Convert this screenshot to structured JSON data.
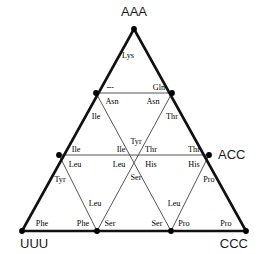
{
  "figure": {
    "colors": {
      "outer_edge": "#111111",
      "inner_line": "#555555",
      "node": "#000000",
      "text": "#000000",
      "corner_text": "#1a1a1a",
      "background": "#ffffff"
    },
    "corners": [
      {
        "id": "aaa",
        "label": "AAA",
        "x": 134,
        "y": 29,
        "text_x": 134,
        "text_y": 16,
        "anchor": "middle"
      },
      {
        "id": "uuu",
        "label": "UUU",
        "x": 22,
        "y": 231,
        "text_x": 20,
        "text_y": 248,
        "anchor": "start"
      },
      {
        "id": "ccc",
        "label": "CCC",
        "x": 246,
        "y": 231,
        "text_x": 248,
        "text_y": 248,
        "anchor": "end"
      },
      {
        "id": "acc",
        "label": "ACC",
        "x": 209,
        "y": 155,
        "text_x": 218,
        "text_y": 159,
        "anchor": "start"
      }
    ],
    "outer_edges": [
      {
        "id": "edge-aaa-uuu",
        "x1": 134,
        "y1": 29,
        "x2": 22,
        "y2": 231
      },
      {
        "id": "edge-uuu-ccc",
        "x1": 22,
        "y1": 231,
        "x2": 246,
        "y2": 231
      },
      {
        "id": "edge-ccc-aaa",
        "x1": 246,
        "y1": 231,
        "x2": 134,
        "y2": 29
      }
    ],
    "inner_lines": [
      {
        "id": "row-gln",
        "x1": 96,
        "y1": 93,
        "x2": 172,
        "y2": 93
      },
      {
        "id": "row-mid",
        "x1": 59,
        "y1": 155,
        "x2": 209,
        "y2": 155
      },
      {
        "id": "diag-a",
        "x1": 96,
        "y1": 93,
        "x2": 171,
        "y2": 231
      },
      {
        "id": "diag-b",
        "x1": 172,
        "y1": 93,
        "x2": 97,
        "y2": 231
      },
      {
        "id": "diag-c",
        "x1": 59,
        "y1": 155,
        "x2": 97,
        "y2": 231
      },
      {
        "id": "diag-d",
        "x1": 209,
        "y1": 155,
        "x2": 171,
        "y2": 231
      }
    ],
    "nodes": [
      {
        "id": "node-apex",
        "x": 134,
        "y": 29
      },
      {
        "id": "node-gln-left",
        "x": 96,
        "y": 93
      },
      {
        "id": "node-gln-right",
        "x": 172,
        "y": 93
      },
      {
        "id": "node-mid-left",
        "x": 59,
        "y": 155
      },
      {
        "id": "node-mid-right",
        "x": 209,
        "y": 155
      },
      {
        "id": "node-bot-left",
        "x": 22,
        "y": 231
      },
      {
        "id": "node-bot-m1",
        "x": 97,
        "y": 231
      },
      {
        "id": "node-bot-m2",
        "x": 171,
        "y": 231
      },
      {
        "id": "node-bot-right",
        "x": 246,
        "y": 231
      }
    ],
    "amino_acids": [
      {
        "id": "aa-lys",
        "label": "Lys",
        "x": 128,
        "y": 58,
        "anchor": "middle"
      },
      {
        "id": "aa-dash",
        "label": "---",
        "x": 110,
        "y": 90,
        "anchor": "middle",
        "kind": "dash"
      },
      {
        "id": "aa-gln",
        "label": "Gln",
        "x": 159,
        "y": 90,
        "anchor": "middle"
      },
      {
        "id": "aa-asn-1",
        "label": "Asn",
        "x": 112,
        "y": 104,
        "anchor": "middle"
      },
      {
        "id": "aa-asn-2",
        "label": "Asn",
        "x": 153,
        "y": 104,
        "anchor": "middle"
      },
      {
        "id": "aa-ile-1",
        "label": "Ile",
        "x": 96,
        "y": 119,
        "anchor": "middle"
      },
      {
        "id": "aa-thr-1",
        "label": "Thr",
        "x": 172,
        "y": 119,
        "anchor": "middle"
      },
      {
        "id": "aa-tyr-1",
        "label": "Tyr",
        "x": 136,
        "y": 144,
        "anchor": "middle"
      },
      {
        "id": "aa-ile-2",
        "label": "Ile",
        "x": 76,
        "y": 152,
        "anchor": "middle"
      },
      {
        "id": "aa-ile-3",
        "label": "Ile",
        "x": 121,
        "y": 152,
        "anchor": "middle"
      },
      {
        "id": "aa-thr-2",
        "label": "Thr",
        "x": 151,
        "y": 152,
        "anchor": "middle"
      },
      {
        "id": "aa-thr-3",
        "label": "Thr",
        "x": 194,
        "y": 152,
        "anchor": "middle"
      },
      {
        "id": "aa-leu-1",
        "label": "Leu",
        "x": 75,
        "y": 167,
        "anchor": "middle"
      },
      {
        "id": "aa-leu-2",
        "label": "Leu",
        "x": 119,
        "y": 167,
        "anchor": "middle"
      },
      {
        "id": "aa-his-1",
        "label": "His",
        "x": 151,
        "y": 167,
        "anchor": "middle"
      },
      {
        "id": "aa-his-2",
        "label": "His",
        "x": 194,
        "y": 167,
        "anchor": "middle"
      },
      {
        "id": "aa-ser-1",
        "label": "Ser",
        "x": 136,
        "y": 180,
        "anchor": "middle"
      },
      {
        "id": "aa-tyr-2",
        "label": "Tyr",
        "x": 60,
        "y": 182,
        "anchor": "middle"
      },
      {
        "id": "aa-pro-1",
        "label": "Pro",
        "x": 209,
        "y": 182,
        "anchor": "middle"
      },
      {
        "id": "aa-leu-3",
        "label": "Leu",
        "x": 95,
        "y": 206,
        "anchor": "middle"
      },
      {
        "id": "aa-leu-4",
        "label": "Leu",
        "x": 174,
        "y": 206,
        "anchor": "middle"
      },
      {
        "id": "aa-phe-1",
        "label": "Phe",
        "x": 42,
        "y": 226,
        "anchor": "middle"
      },
      {
        "id": "aa-phe-2",
        "label": "Phe",
        "x": 83,
        "y": 226,
        "anchor": "middle"
      },
      {
        "id": "aa-ser-2",
        "label": "Ser",
        "x": 110,
        "y": 226,
        "anchor": "middle"
      },
      {
        "id": "aa-ser-3",
        "label": "Ser",
        "x": 157,
        "y": 226,
        "anchor": "middle"
      },
      {
        "id": "aa-pro-2",
        "label": "Pro",
        "x": 184,
        "y": 226,
        "anchor": "middle"
      },
      {
        "id": "aa-pro-3",
        "label": "Pro",
        "x": 226,
        "y": 226,
        "anchor": "middle"
      }
    ]
  }
}
